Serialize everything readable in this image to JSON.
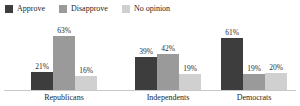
{
  "legend": {
    "position": "top-left",
    "items": [
      {
        "label": "Approve",
        "color": "#3d3d3d",
        "swatch_name": "legend-swatch-approve"
      },
      {
        "label": "Disapprove",
        "color": "#9a9a9a",
        "swatch_name": "legend-swatch-disapprove"
      },
      {
        "label": "No opinion",
        "color": "#d0d0d0",
        "swatch_name": "legend-swatch-no-opinion"
      }
    ]
  },
  "chart_data": {
    "type": "bar",
    "title": "",
    "xlabel": "",
    "ylabel": "",
    "ylim": [
      0,
      70
    ],
    "grid": false,
    "legend_position": "top-left",
    "value_suffix": "%",
    "categories": [
      "Republicans",
      "Independents",
      "Democrats"
    ],
    "series": [
      {
        "name": "Approve",
        "color": "#3d3d3d",
        "values": [
          21,
          63,
          61
        ]
      },
      {
        "name": "Disapprove",
        "color": "#9a9a9a",
        "values": [
          63,
          42,
          19
        ]
      },
      {
        "name": "No opinion",
        "color": "#d0d0d0",
        "values": [
          16,
          19,
          20
        ]
      }
    ],
    "data_labels": {
      "Republicans": [
        "21%",
        "63%",
        "16%"
      ],
      "Independents": [
        "39%",
        "42%",
        "19%"
      ],
      "Democrats": [
        "61%",
        "19%",
        "20%"
      ]
    },
    "groups": [
      {
        "label": "Republicans",
        "bars": [
          {
            "series": "Approve",
            "value": 21,
            "label": "21%",
            "color": "#3d3d3d"
          },
          {
            "series": "Disapprove",
            "value": 63,
            "label": "63%",
            "color": "#9a9a9a"
          },
          {
            "series": "No opinion",
            "value": 16,
            "label": "16%",
            "color": "#d0d0d0"
          }
        ]
      },
      {
        "label": "Independents",
        "bars": [
          {
            "series": "Approve",
            "value": 39,
            "label": "39%",
            "color": "#3d3d3d"
          },
          {
            "series": "Disapprove",
            "value": 42,
            "label": "42%",
            "color": "#9a9a9a"
          },
          {
            "series": "No opinion",
            "value": 19,
            "label": "19%",
            "color": "#d0d0d0"
          }
        ]
      },
      {
        "label": "Democrats",
        "bars": [
          {
            "series": "Approve",
            "value": 61,
            "label": "61%",
            "color": "#3d3d3d"
          },
          {
            "series": "Disapprove",
            "value": 19,
            "label": "19%",
            "color": "#9a9a9a"
          },
          {
            "series": "No opinion",
            "value": 20,
            "label": "20%",
            "color": "#d0d0d0"
          }
        ]
      }
    ]
  },
  "axis": {
    "baseline_color": "#c8c8c8"
  }
}
